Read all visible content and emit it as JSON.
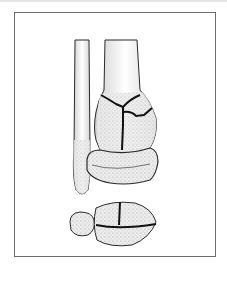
{
  "figure": {
    "type": "medical-illustration",
    "colors": {
      "frame": "#6b6b6b",
      "bone_fill": "#e9e9e9",
      "bone_stipple": "#9a9a9a",
      "outline": "#2a2a2a",
      "fracture_line": "#111111",
      "background": "#ffffff"
    },
    "elements": [
      {
        "name": "fibula",
        "view": "anterior"
      },
      {
        "name": "tibia-shaft",
        "view": "anterior"
      },
      {
        "name": "distal-tibia-fractured",
        "view": "anterior",
        "fracture_lines": 3
      },
      {
        "name": "talus",
        "view": "anterior"
      },
      {
        "name": "axial-fragments",
        "view": "axial",
        "fracture_lines": 2
      }
    ]
  }
}
